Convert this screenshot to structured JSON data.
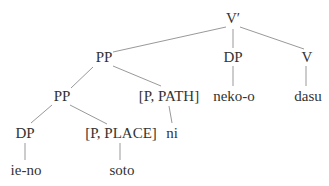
{
  "figure": {
    "kind": "syntax-tree",
    "text_color": "#333333",
    "line_color": "#999999",
    "background": "#ffffff"
  },
  "tree": {
    "root_label": "V′",
    "nodes": [
      {
        "id": "v-bar",
        "label": "V′"
      },
      {
        "id": "pp-outer",
        "label": "PP"
      },
      {
        "id": "dp-obj",
        "label": "DP"
      },
      {
        "id": "v-head",
        "label": "V"
      },
      {
        "id": "pp-inner",
        "label": "PP"
      },
      {
        "id": "p-path",
        "label": "[P, PATH]"
      },
      {
        "id": "neko-o",
        "label": "neko-o"
      },
      {
        "id": "dasu",
        "label": "dasu"
      },
      {
        "id": "dp-inner",
        "label": "DP"
      },
      {
        "id": "p-place",
        "label": "[P, PLACE]"
      },
      {
        "id": "ni",
        "label": "ni"
      },
      {
        "id": "ie-no",
        "label": "ie-no"
      },
      {
        "id": "soto",
        "label": "soto"
      }
    ],
    "edges": [
      {
        "from": "v-bar",
        "to": "pp-outer"
      },
      {
        "from": "v-bar",
        "to": "dp-obj"
      },
      {
        "from": "v-bar",
        "to": "v-head"
      },
      {
        "from": "pp-outer",
        "to": "pp-inner"
      },
      {
        "from": "pp-outer",
        "to": "p-path"
      },
      {
        "from": "dp-obj",
        "to": "neko-o"
      },
      {
        "from": "v-head",
        "to": "dasu"
      },
      {
        "from": "pp-inner",
        "to": "dp-inner"
      },
      {
        "from": "pp-inner",
        "to": "p-place"
      },
      {
        "from": "p-path",
        "to": "ni"
      },
      {
        "from": "dp-inner",
        "to": "ie-no"
      },
      {
        "from": "p-place",
        "to": "soto"
      }
    ]
  }
}
